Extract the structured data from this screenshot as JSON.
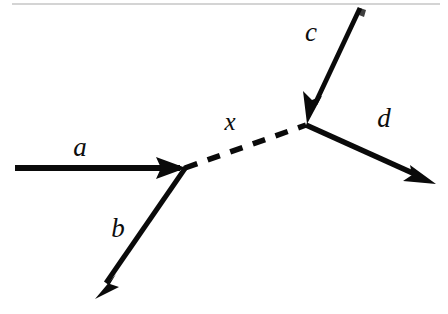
{
  "figure": {
    "type": "feynman-diagram",
    "background_color": "#ffffff",
    "ink_color": "#0a0a0a",
    "width": 448,
    "height": 314
  },
  "labels": {
    "a": "a",
    "b": "b",
    "c": "c",
    "d": "d",
    "x": "x"
  },
  "label_positions": {
    "a": {
      "x": 80,
      "y": 156
    },
    "b": {
      "x": 118,
      "y": 237
    },
    "c": {
      "x": 311,
      "y": 41
    },
    "d": {
      "x": 384,
      "y": 127
    },
    "x": {
      "x": 230,
      "y": 130
    }
  },
  "vertices": {
    "left": {
      "x": 185,
      "y": 168
    },
    "right": {
      "x": 306,
      "y": 125
    }
  },
  "lines": [
    {
      "name": "a",
      "style": "solid",
      "direction": "incoming",
      "from": {
        "x": 15,
        "y": 168
      },
      "to": {
        "x": 185,
        "y": 168
      },
      "arrow_at": "end",
      "stroke_width": 5.5
    },
    {
      "name": "b",
      "style": "solid",
      "direction": "outgoing",
      "from": {
        "x": 185,
        "y": 168
      },
      "to": {
        "x": 96,
        "y": 297
      },
      "arrow_at": "end",
      "stroke_width": 4.5
    },
    {
      "name": "x",
      "style": "dashed",
      "direction": "propagator",
      "from": {
        "x": 185,
        "y": 168
      },
      "to": {
        "x": 306,
        "y": 125
      },
      "arrow_at": "none",
      "stroke_width": 5,
      "dash_pattern": "13 11"
    },
    {
      "name": "c",
      "style": "solid",
      "direction": "incoming",
      "from": {
        "x": 360,
        "y": 8
      },
      "to": {
        "x": 306,
        "y": 125
      },
      "arrow_at": "end",
      "stroke_width": 4.5
    },
    {
      "name": "d",
      "style": "solid",
      "direction": "outgoing",
      "from": {
        "x": 306,
        "y": 125
      },
      "to": {
        "x": 435,
        "y": 183
      },
      "arrow_at": "end",
      "stroke_width": 5
    }
  ],
  "artifacts": {
    "top_scan_line": {
      "x1": 12,
      "y1": 4,
      "x2": 440,
      "y2": 4
    },
    "smudge": {
      "x": 363,
      "y": 12
    }
  }
}
